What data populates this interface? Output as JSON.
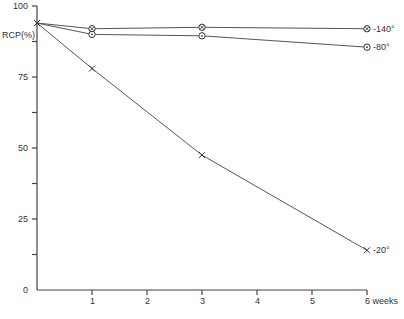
{
  "chart_data": {
    "type": "line",
    "title": "",
    "xlabel": "weeks",
    "ylabel": "RCP(%)",
    "x": [
      0,
      1,
      3,
      6
    ],
    "xticks": [
      1,
      2,
      3,
      4,
      5,
      6
    ],
    "xtick_labels": [
      "1",
      "2",
      "3",
      "4",
      "5",
      "6 weeks"
    ],
    "yticks": [
      0,
      25,
      50,
      75,
      100
    ],
    "ytick_labels": [
      "0",
      "25",
      "50",
      "75",
      "100"
    ],
    "ylim": [
      0,
      100
    ],
    "xlim": [
      0,
      6
    ],
    "grid": false,
    "legend_position": "inline-right",
    "series": [
      {
        "name": "-140°",
        "marker": "circle-x",
        "values": [
          94,
          92,
          92.5,
          92
        ]
      },
      {
        "name": "-80°",
        "marker": "circle-dot",
        "values": [
          94,
          90,
          89.5,
          85.5
        ]
      },
      {
        "name": "-20°",
        "marker": "x",
        "values": [
          94,
          78,
          47.5,
          14
        ]
      }
    ]
  }
}
